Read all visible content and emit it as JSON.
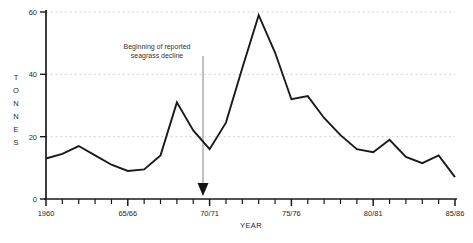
{
  "chart_data": {
    "type": "line",
    "title": "",
    "xlabel": "YEAR",
    "ylabel": "TONNES",
    "ylim": [
      0,
      60
    ],
    "yticks": [
      0,
      20,
      40,
      60
    ],
    "ytick_labels": [
      "0",
      "20",
      "40",
      "60"
    ],
    "xlim": [
      1960,
      1985
    ],
    "xticks": [
      1960,
      1965,
      1970,
      1975,
      1980,
      1985
    ],
    "xtick_labels": [
      "1960",
      "65/66",
      "70/71",
      "75/76",
      "80/81",
      "85/86"
    ],
    "minor_xticks_per_interval": 5,
    "grid": "horizontal-dotted",
    "legend": "none",
    "line_color": "#1a1a1a",
    "grid_color": "#bdbdbd",
    "axis_color": "#1a1a1a",
    "series": [
      {
        "name": "Catch",
        "x": [
          1960,
          1961,
          1962,
          1963,
          1964,
          1965,
          1966,
          1967,
          1968,
          1969,
          1970,
          1971,
          1972,
          1973,
          1974,
          1975,
          1976,
          1977,
          1978,
          1979,
          1980,
          1981,
          1982,
          1983,
          1984,
          1985
        ],
        "values": [
          13,
          14.5,
          17,
          14,
          11,
          9,
          9.5,
          14,
          31,
          22,
          16,
          24.5,
          42,
          59,
          47,
          32,
          33,
          26,
          20.5,
          16,
          15,
          19,
          13.5,
          11.5,
          14,
          7
        ]
      }
    ],
    "annotations": [
      {
        "name": "seagrass-decline-note",
        "text_line1": "Beginning of reported",
        "text_line2": "seagrass decline",
        "arrow_at_x": "70/71",
        "arrow_direction": "down"
      }
    ]
  },
  "footer": {
    "partial_caption": ""
  }
}
